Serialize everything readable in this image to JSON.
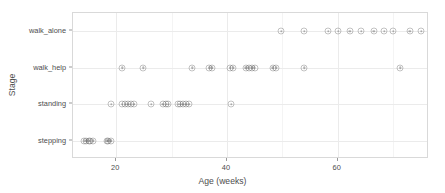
{
  "chart_data": {
    "type": "scatter",
    "title": "",
    "xlabel": "Age (weeks)",
    "ylabel": "Stage",
    "grid": true,
    "legend": null,
    "xlim": [
      12.2,
      76.5
    ],
    "xticks": [
      20,
      40,
      60
    ],
    "xtick_labels": [
      "20",
      "40",
      "60"
    ],
    "xticks_minor": [
      10,
      30,
      50,
      70
    ],
    "ycategories": [
      "stepping",
      "standing",
      "walk_help",
      "walk_alone"
    ],
    "point_style": {
      "marker": "circle-open-with-dot",
      "color": "#3c3c3c",
      "alpha": 0.35,
      "size_px": 7
    },
    "series": [
      {
        "name": "stepping",
        "x": [
          14.2,
          14.6,
          15.0,
          15.3,
          15.9,
          18.3,
          18.6,
          19.0
        ]
      },
      {
        "name": "standing",
        "x": [
          19.1,
          21.1,
          21.6,
          22.1,
          22.6,
          23.2,
          26.3,
          28.4,
          29.0,
          29.4,
          31.2,
          31.6,
          32.0,
          32.6,
          33.1,
          40.8
        ]
      },
      {
        "name": "walk_help",
        "x": [
          21.1,
          24.9,
          33.7,
          36.8,
          37.3,
          40.6,
          41.1,
          43.4,
          43.9,
          44.5,
          45.0,
          48.3,
          48.9,
          54.0,
          71.3
        ]
      },
      {
        "name": "walk_alone",
        "x": [
          49.8,
          54.0,
          58.3,
          60.1,
          62.2,
          64.3,
          66.5,
          68.4,
          70.0,
          73.0,
          75.1
        ]
      }
    ]
  },
  "axes": {
    "y_title": "Stage",
    "x_title": "Age (weeks)",
    "y_labels": [
      "walk_alone",
      "walk_help",
      "standing",
      "stepping"
    ],
    "x_labels": [
      "20",
      "40",
      "60"
    ]
  }
}
